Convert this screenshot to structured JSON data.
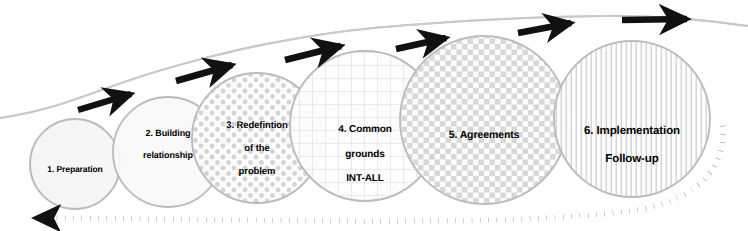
{
  "diagram": {
    "background_color": "#ffffff",
    "circle_stroke_color": "#b4b4b4",
    "arrow_color": "#111111",
    "pattern_color": "#cfcfcf",
    "text_color": "#000000",
    "stages": [
      {
        "id": "stage-1",
        "number": "1.",
        "label": "1. Preparation",
        "lines": [
          "1. Preparation"
        ],
        "fill_pattern": "solid-light",
        "cx": 75,
        "cy": 164,
        "r": 45,
        "font_size": 8.5,
        "label_cx": 75,
        "label_cy": 172
      },
      {
        "id": "stage-2",
        "number": "2.",
        "label": "2. Building relationship",
        "lines": [
          "2. Building",
          "relationship"
        ],
        "fill_pattern": "solid-light",
        "cx": 168,
        "cy": 152,
        "r": 55,
        "font_size": 9,
        "label_cx": 168,
        "label_cy": 150
      },
      {
        "id": "stage-3",
        "number": "3.",
        "label": "3. Redefintion of the problem",
        "lines": [
          "3. Redefintion",
          "of the",
          "problem"
        ],
        "fill_pattern": "dots",
        "cx": 257,
        "cy": 138,
        "r": 65,
        "font_size": 9.5,
        "label_cx": 257,
        "label_cy": 136
      },
      {
        "id": "stage-4",
        "number": "4.",
        "label": "4. Common grounds INT-ALL",
        "lines": [
          "4. Common",
          "grounds",
          "INT-ALL"
        ],
        "fill_pattern": "grid",
        "cx": 365,
        "cy": 126,
        "r": 75,
        "font_size": 10,
        "label_cx": 365,
        "label_cy": 131
      },
      {
        "id": "stage-5",
        "number": "5.",
        "label": "5. Agreements",
        "lines": [
          "5. Agreements"
        ],
        "fill_pattern": "checker",
        "cx": 484,
        "cy": 120,
        "r": 84,
        "font_size": 10.5,
        "label_cx": 484,
        "label_cy": 136
      },
      {
        "id": "stage-6",
        "number": "6.",
        "label": "6. Implementation Follow-up",
        "lines": [
          "6. Implementation",
          "Follow-up"
        ],
        "fill_pattern": "vertical-lines",
        "cx": 632,
        "cy": 119,
        "r": 78,
        "font_size": 11.5,
        "label_cx": 632,
        "label_cy": 126
      }
    ],
    "forward_arrows": [
      {
        "id": "arrow-1",
        "from_x": 78,
        "from_y": 110,
        "to_x": 139,
        "to_y": 92
      },
      {
        "id": "arrow-2",
        "from_x": 176,
        "from_y": 81,
        "to_x": 240,
        "to_y": 63
      },
      {
        "id": "arrow-3",
        "from_x": 285,
        "from_y": 60,
        "to_x": 348,
        "to_y": 44
      },
      {
        "id": "arrow-4",
        "from_x": 396,
        "from_y": 49,
        "to_x": 452,
        "to_y": 37
      },
      {
        "id": "arrow-5",
        "from_x": 518,
        "from_y": 33,
        "to_x": 578,
        "to_y": 22
      },
      {
        "id": "arrow-6",
        "from_x": 622,
        "from_y": 20,
        "to_x": 694,
        "to_y": 19
      }
    ],
    "flow_curve": {
      "id": "ascending-flow-curve",
      "description": "light gray ascending curve passing through the tops of all circles"
    },
    "feedback_arrow": {
      "id": "feedback-dotted-arrow",
      "description": "dotted loop from right side of stage 6 back to the left, arrowhead pointing left",
      "style": "dotted",
      "direction": "right-to-left"
    }
  }
}
